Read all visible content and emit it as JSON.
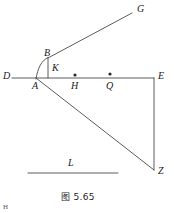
{
  "figure": {
    "caption": "图 5.65",
    "background_color": "#ffffff",
    "stroke_color": "#4a4a4a",
    "label_color": "#1a1a1a",
    "corner_mark": "H"
  },
  "points": [
    {
      "id": "G",
      "label": "G",
      "x": 132,
      "y": 13,
      "label_x": 137,
      "label_y": 4,
      "dot": false
    },
    {
      "id": "B",
      "label": "B",
      "x": 48,
      "y": 58,
      "label_x": 44,
      "label_y": 48,
      "dot": false
    },
    {
      "id": "K",
      "label": "K",
      "x": 48,
      "y": 78,
      "label_x": 52,
      "label_y": 63,
      "dot": false
    },
    {
      "id": "D",
      "label": "D",
      "x": 12,
      "y": 78,
      "label_x": 3,
      "label_y": 71,
      "dot": false
    },
    {
      "id": "A",
      "label": "A",
      "x": 36,
      "y": 78,
      "label_x": 32,
      "label_y": 81,
      "dot": false
    },
    {
      "id": "H",
      "label": "H",
      "x": 75,
      "y": 78,
      "label_x": 71,
      "label_y": 81,
      "dot": true
    },
    {
      "id": "Q",
      "label": "Q",
      "x": 110,
      "y": 78,
      "label_x": 106,
      "label_y": 81,
      "dot": true
    },
    {
      "id": "E",
      "label": "E",
      "x": 154,
      "y": 78,
      "label_x": 158,
      "label_y": 71,
      "dot": false
    },
    {
      "id": "Z",
      "label": "Z",
      "x": 154,
      "y": 170,
      "label_x": 158,
      "label_y": 166,
      "dot": false
    },
    {
      "id": "L",
      "label": "L",
      "x": 72,
      "y": 173,
      "label_x": 68,
      "label_y": 158,
      "dot": false
    }
  ],
  "segments": [
    {
      "name": "line-D-E",
      "from": "D",
      "to": "E",
      "x1": 12,
      "y1": 78,
      "x2": 154,
      "y2": 78
    },
    {
      "name": "line-B-G",
      "from": "B",
      "to": "G",
      "x1": 48,
      "y1": 58,
      "x2": 132,
      "y2": 13
    },
    {
      "name": "line-B-K",
      "from": "B",
      "to": "K",
      "x1": 48,
      "y1": 58,
      "x2": 48,
      "y2": 78
    },
    {
      "name": "line-A-Z",
      "from": "A",
      "to": "Z",
      "x1": 36,
      "y1": 78,
      "x2": 154,
      "y2": 170
    },
    {
      "name": "line-E-Z",
      "from": "E",
      "to": "Z",
      "x1": 154,
      "y1": 78,
      "x2": 154,
      "y2": 170
    },
    {
      "name": "line-L",
      "from": "L1",
      "to": "L2",
      "x1": 28,
      "y1": 173,
      "x2": 118,
      "y2": 173
    }
  ],
  "curves": [
    {
      "name": "arc-A-B",
      "path": "M 36 79 C 37.5 68 42 60 48 57.5"
    }
  ],
  "dots": [
    {
      "name": "dot-H",
      "x": 75,
      "y": 75,
      "r": 1.6
    },
    {
      "name": "dot-Q",
      "x": 110,
      "y": 74,
      "r": 1.6
    }
  ],
  "caption_position": {
    "x": 61,
    "y": 190
  }
}
